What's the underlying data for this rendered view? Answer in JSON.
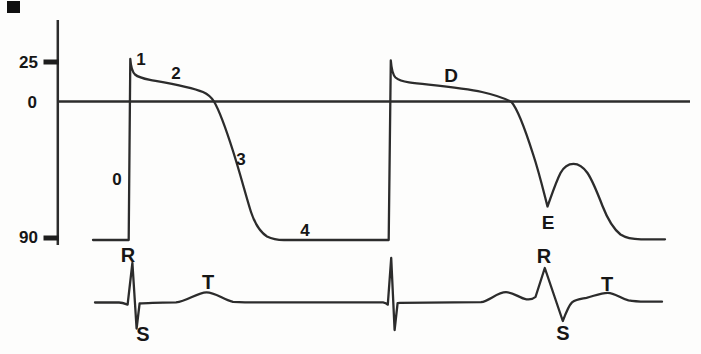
{
  "figure": {
    "background_color": "#fdfdfc",
    "line_color": "#2c2c2c",
    "text_color": "#161616"
  },
  "labels": {
    "axis": {
      "v25": "25",
      "v0": "0",
      "v90": "90"
    },
    "phases": {
      "p0": "0",
      "p1": "1",
      "p2": "2",
      "p3": "3",
      "p4": "4"
    },
    "ap2": {
      "d": "D",
      "e": "E"
    },
    "ecg": {
      "r1": "R",
      "s1": "S",
      "t1": "T",
      "r2": "R",
      "s2": "S",
      "t2": "T"
    }
  },
  "chart_data": {
    "type": "line",
    "title": "",
    "xlabel": "",
    "ylabel": "",
    "y_tick_labels": [
      "25",
      "0",
      "90"
    ],
    "grid": false,
    "series": [
      {
        "name": "action potential beat 1",
        "annotations": [
          "0 upstroke",
          "1 early repolarization peak",
          "2 plateau",
          "3 repolarization",
          "4 resting potential"
        ],
        "key_points_mV": {
          "resting": -90,
          "overshoot_peak": 27,
          "plateau_start": 15,
          "zero_crossing": 0
        }
      },
      {
        "name": "action potential beat 2",
        "annotations": [
          "D plateau",
          "E early afterdepolarization notch with secondary hump"
        ],
        "key_points_mV": {
          "overshoot_peak": 26,
          "plateau": 13,
          "E_notch": -72,
          "hump_top": -43,
          "resting": -90
        }
      },
      {
        "name": "ECG",
        "annotations": [
          "R",
          "S",
          "T",
          "unlabeled QRS",
          "R",
          "S",
          "T"
        ],
        "wave_order": [
          "QRS",
          "T",
          "QRS",
          "P-like hump",
          "QRS",
          "T"
        ]
      }
    ]
  },
  "geometry": {
    "y_axis": "M 57.8 20 L 57.8 245",
    "baseline": "M 57.8 101.5 L 690 101.5",
    "tick_25": "M 43.5 62 L 58.8 62",
    "tick_90": "M 43.5 238 L 58.8 238",
    "action_potential": "M 93 240 L 128.7 240 L 130.3 59 C 130.8 66 131.5 71 135 74.5 C 138 77 143 78.5 150 79.8 C 168 83 190 86.5 203 92 C 209 94.7 211.5 97.5 214 101.5 C 219 110 226 129 233 151 C 240 173 246 196 251 212 C 255 224 260 232 267 236.5 C 272 239 277 240 284 240 L 388.7 240 L 390.8 60.5 C 391.4 68 392 74 395.5 77.5 C 398.5 80.2 403 81.6 409 82.4 C 430 85 462 87.5 482 92 C 494 94.7 503 97.5 511.5 102 C 518.5 110 526 132 533 154 C 539 172 543.5 191 547.5 206.5 C 551 197 555.5 183 560.5 173 C 564 166.5 568 163.8 573.5 163.8 C 579 163.8 583 166.5 587.5 173 C 592.5 180.5 597.5 193 602.5 206 C 607 217.5 613 228.5 620.5 234.5 C 626 238 633 239.2 641 239.3 L 665 239.3",
    "ecg": "M 95 302.5 L 119 302.5 C 122.5 302.5 125 303.6 127.6 304.6 L 132.4 263 L 136.6 328.5 L 139.6 303.5 C 146 302.8 160 302.5 176 302.3 C 187 301.5 197 292.5 206.5 292.3 C 215.5 292.3 223 299.5 233 301.8 L 245 302.4 L 383 302.4 C 385.5 302.8 386.8 303.6 387.8 304.6 L 391.2 258 L 394.6 330 L 397.6 303.2 L 400 302.8 L 481 302.2 C 489 301 497.5 292.3 506 292.2 C 513.5 292.2 519.5 298.2 526.5 299.3 C 530.5 299.8 533 299.2 535.5 297 L 544.8 268 L 562.8 321 C 565.8 313 568.6 305.5 572 302.3 C 576.5 298.8 581 298.8 586.5 297.8 C 593.5 296.2 600.5 292.8 607.8 292.8 C 615 292.9 620.5 298.5 628.5 300.4 C 634 301.4 640 301.6 646 301.7 L 662 301.7"
  }
}
